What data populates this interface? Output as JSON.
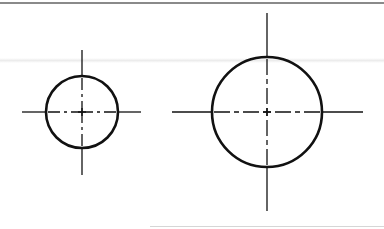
{
  "figure": {
    "stroke_color": "#111111",
    "background": "#ffffff",
    "shapes": [
      {
        "name": "small-circle",
        "cx": 82,
        "cy": 112,
        "r": 36,
        "horizontal_centerline": {
          "x1": 22,
          "x2": 141
        },
        "vertical_centerline": {
          "y1": 50,
          "y2": 175
        }
      },
      {
        "name": "large-circle",
        "cx": 267,
        "cy": 112,
        "r": 55,
        "horizontal_centerline": {
          "x1": 172,
          "x2": 363
        },
        "vertical_centerline": {
          "y1": 13,
          "y2": 211
        }
      }
    ]
  }
}
